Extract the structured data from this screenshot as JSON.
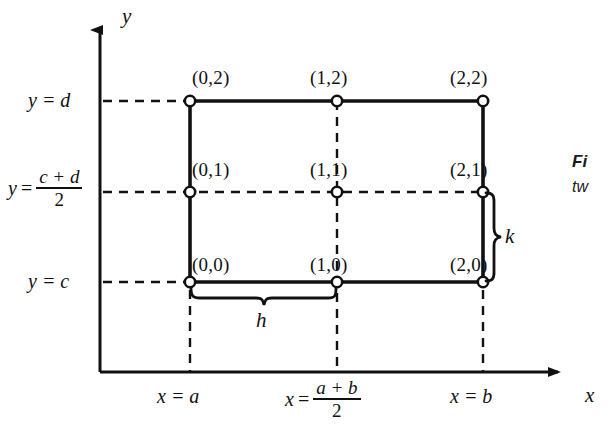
{
  "figure": {
    "background_color": "#ffffff",
    "ink_color": "#111111",
    "axes": {
      "x_axis_label": "x",
      "y_axis_label": "y",
      "x_arrow_icon": "arrow-right-icon",
      "y_arrow_icon": "arrow-up-icon",
      "origin_px": {
        "x": 100,
        "y": 372
      }
    },
    "y_gridline_labels": [
      {
        "id": "y-top",
        "type": "simple",
        "lhs": "y",
        "op": "=",
        "rhs": "d",
        "text": "y = d",
        "py": 101
      },
      {
        "id": "y-mid",
        "type": "fraction",
        "lhs": "y",
        "op": "=",
        "numerator": "c + d",
        "denominator": "2",
        "text": "y = (c + d)/2",
        "py": 192
      },
      {
        "id": "y-bottom",
        "type": "simple",
        "lhs": "y",
        "op": "=",
        "rhs": "c",
        "text": "y = c",
        "py": 282
      }
    ],
    "x_gridline_labels": [
      {
        "id": "x-left",
        "type": "simple",
        "lhs": "x",
        "op": "=",
        "rhs": "a",
        "text": "x = a",
        "px": 190
      },
      {
        "id": "x-mid",
        "type": "fraction",
        "lhs": "x",
        "op": "=",
        "numerator": "a + b",
        "denominator": "2",
        "text": "x = (a + b)/2",
        "px": 337
      },
      {
        "id": "x-right",
        "type": "simple",
        "lhs": "x",
        "op": "=",
        "rhs": "b",
        "text": "x = b",
        "px": 483
      }
    ],
    "grid_nodes": [
      {
        "id": "n-0-2",
        "label": "(0,2)",
        "px": 190,
        "py": 101
      },
      {
        "id": "n-1-2",
        "label": "(1,2)",
        "px": 337,
        "py": 101
      },
      {
        "id": "n-2-2",
        "label": "(2,2)",
        "px": 483,
        "py": 101
      },
      {
        "id": "n-0-1",
        "label": "(0,1)",
        "px": 190,
        "py": 192
      },
      {
        "id": "n-1-1",
        "label": "(1,1)",
        "px": 337,
        "py": 192
      },
      {
        "id": "n-2-1",
        "label": "(2,1)",
        "px": 483,
        "py": 192
      },
      {
        "id": "n-0-0",
        "label": "(0,0)",
        "px": 190,
        "py": 282
      },
      {
        "id": "n-1-0",
        "label": "(1,0)",
        "px": 337,
        "py": 282
      },
      {
        "id": "n-2-0",
        "label": "(2,0)",
        "px": 483,
        "py": 282
      }
    ],
    "braces": [
      {
        "id": "brace-h",
        "label": "h",
        "orientation": "horizontal",
        "from_px": 190,
        "to_px": 337,
        "at_py": 290
      },
      {
        "id": "brace-k",
        "label": "k",
        "orientation": "vertical",
        "from_py": 192,
        "to_py": 282,
        "at_px": 491
      }
    ],
    "caption": {
      "title_fragment": "Fi",
      "body_fragment": "tw"
    }
  }
}
